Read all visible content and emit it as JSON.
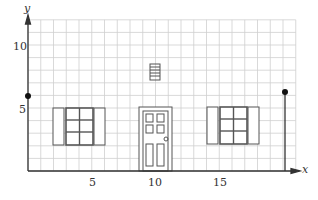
{
  "figure": {
    "axes": {
      "x_label": "x",
      "y_label": "y",
      "x_ticks": [
        {
          "value": 5,
          "label": "5"
        },
        {
          "value": 10,
          "label": "10"
        },
        {
          "value": 15,
          "label": "15"
        }
      ],
      "y_ticks": [
        {
          "value": 5,
          "label": "5"
        },
        {
          "value": 10,
          "label": "10"
        }
      ],
      "x_range": [
        0,
        21
      ],
      "y_range": [
        0,
        12
      ]
    },
    "grid": {
      "on": true,
      "cell_units": 1,
      "color": "#c8c8c8"
    },
    "points": [
      {
        "name": "left-point",
        "x": 0,
        "y": 6
      },
      {
        "name": "right-point",
        "x": 20,
        "y": 6.3
      }
    ],
    "vertical_segment": {
      "x": 20,
      "y_from": 0,
      "y_to": 6.3
    },
    "house_facade": {
      "vent": {
        "x": 10,
        "y": 8,
        "slats": 5
      },
      "door": {
        "x_from": 9,
        "x_to": 11.5,
        "y_from": 0,
        "y_to": 5,
        "panels": 6,
        "knob": true
      },
      "left_window": {
        "x_from": 3,
        "x_to": 6,
        "y_from": 2,
        "y_to": 5,
        "panes": 6,
        "shutters": 2
      },
      "right_window": {
        "x_from": 15,
        "x_to": 18,
        "y_from": 2,
        "y_to": 5,
        "panes": 6,
        "shutters": 2
      }
    }
  }
}
